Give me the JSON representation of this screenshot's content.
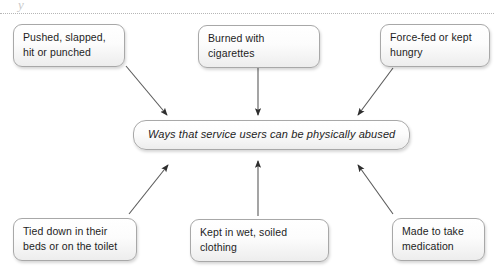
{
  "page": {
    "background_color": "#ffffff",
    "width": 494,
    "height": 280,
    "crop_glyph": "y",
    "divider_style": "dotted",
    "divider_color": "#b6b6b6"
  },
  "diagram": {
    "type": "spider-converging",
    "center": {
      "id": "center",
      "label": "Ways that service users can be physically abused",
      "emphasis": "italic"
    },
    "nodes": [
      {
        "id": "top-left",
        "label": "Pushed, slapped, hit or punched",
        "position": "top-left"
      },
      {
        "id": "top-mid",
        "label": "Burned with cigarettes",
        "position": "top-center"
      },
      {
        "id": "top-right",
        "label": "Force-fed or kept hungry",
        "position": "top-right"
      },
      {
        "id": "bottom-left",
        "label": "Tied down in their beds or on the toilet",
        "position": "bottom-left"
      },
      {
        "id": "bottom-mid",
        "label": "Kept in wet, soiled clothing",
        "position": "bottom-center"
      },
      {
        "id": "bottom-right",
        "label": "Made to take medication",
        "position": "bottom-right"
      }
    ],
    "connectors": [
      {
        "id": "arrow-top-left",
        "from": "top-left",
        "to": "center",
        "direction": "down-right",
        "x1": 126,
        "y1": 66,
        "x2": 167,
        "y2": 116
      },
      {
        "id": "arrow-top-mid",
        "from": "top-mid",
        "to": "center",
        "direction": "down",
        "x1": 258,
        "y1": 54,
        "x2": 258,
        "y2": 116
      },
      {
        "id": "arrow-top-right",
        "from": "top-right",
        "to": "center",
        "direction": "down-left",
        "x1": 393,
        "y1": 68,
        "x2": 357,
        "y2": 116
      },
      {
        "id": "arrow-bottom-left",
        "from": "bottom-left",
        "to": "center",
        "direction": "up-right",
        "x1": 129,
        "y1": 214,
        "x2": 168,
        "y2": 164
      },
      {
        "id": "arrow-bottom-mid",
        "from": "bottom-mid",
        "to": "center",
        "direction": "up",
        "x1": 258,
        "y1": 216,
        "x2": 258,
        "y2": 160
      },
      {
        "id": "arrow-bottom-right",
        "from": "bottom-right",
        "to": "center",
        "direction": "up-left",
        "x1": 393,
        "y1": 214,
        "x2": 357,
        "y2": 164
      }
    ],
    "colors": {
      "node_border": "#a8a8a8",
      "node_fill_top": "#ffffff",
      "node_fill_bottom": "#ededed",
      "arrow": "#3b3b3b",
      "text": "#1d1d1d"
    }
  }
}
